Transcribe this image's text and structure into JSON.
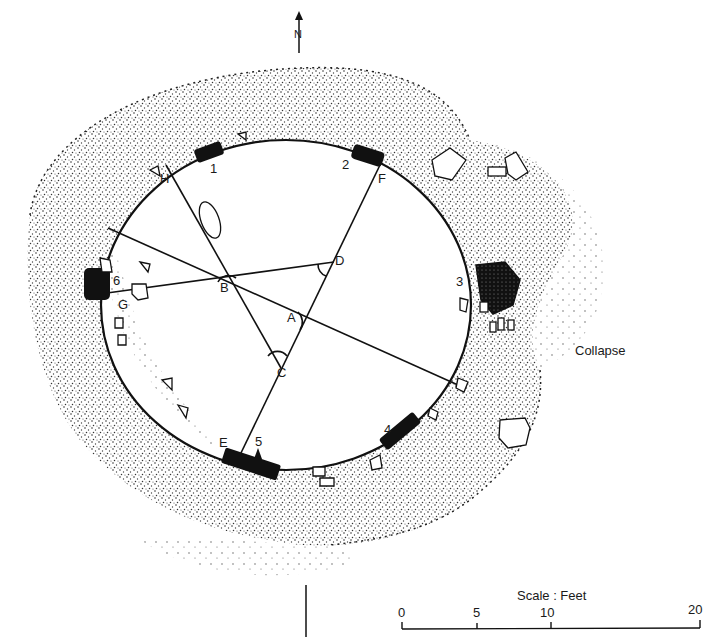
{
  "diagram": {
    "type": "archaeological site plan (stone circle)",
    "north_arrow": {
      "label": "N"
    },
    "points": {
      "A": {
        "label": "A"
      },
      "B": {
        "label": "B"
      },
      "C": {
        "label": "C"
      },
      "D": {
        "label": "D"
      },
      "E": {
        "label": "E"
      },
      "F": {
        "label": "F"
      },
      "G": {
        "label": "G"
      },
      "H": {
        "label": "H"
      }
    },
    "stones": [
      {
        "number": "1"
      },
      {
        "number": "2"
      },
      {
        "number": "3"
      },
      {
        "number": "4"
      },
      {
        "number": "5"
      },
      {
        "number": "6"
      }
    ],
    "annotations": {
      "collapse": "Collapse"
    },
    "scale": {
      "title": "Scale : Feet",
      "ticks": [
        "0",
        "5",
        "10",
        "20"
      ]
    },
    "colors": {
      "ink": "#1a1a1a",
      "paper": "#ffffff",
      "stone_fill": "#111111"
    }
  }
}
